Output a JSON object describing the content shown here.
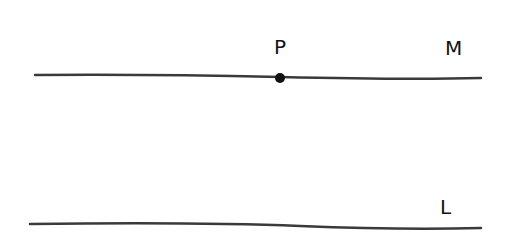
{
  "diagram": {
    "lines": [
      {
        "label": "M",
        "x1": 35,
        "y1": 75,
        "x2": 481,
        "y2": 78
      },
      {
        "label": "L",
        "x1": 30,
        "y1": 224,
        "x2": 481,
        "y2": 228
      }
    ],
    "point": {
      "label": "P",
      "x": 280,
      "y": 78
    },
    "stroke_color": "#3a3a3a"
  }
}
